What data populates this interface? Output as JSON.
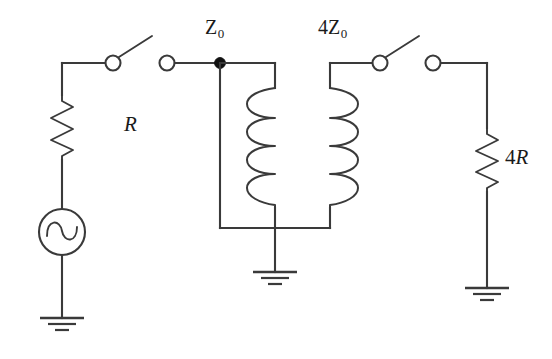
{
  "figure": {
    "name": "impedance-matching-transformer-circuit",
    "background_color": "#ffffff",
    "line_color": "#3a3a3a",
    "node_color": "#111111",
    "width": 552,
    "height": 359
  },
  "labels": {
    "source_resistor": "R",
    "load_resistor_prefix": "4",
    "load_resistor": "R",
    "primary_impedance_symbol": "Z",
    "primary_impedance_subscript": "0",
    "secondary_impedance_prefix": "4",
    "secondary_impedance_symbol": "Z",
    "secondary_impedance_subscript": "0"
  },
  "components": [
    {
      "name": "ac-voltage-source",
      "type": "ac-source",
      "symbol": "sine-wave-in-circle",
      "center": [
        62,
        232
      ],
      "radius": 23
    },
    {
      "name": "source-resistor",
      "type": "resistor",
      "symbol": "zigzag",
      "label": "R",
      "x": 62,
      "y_top": 95,
      "y_bottom": 160,
      "zigzag_peaks": 6
    },
    {
      "name": "load-resistor",
      "type": "resistor",
      "symbol": "zigzag",
      "label": "4R",
      "x": 487,
      "y_top": 128,
      "y_bottom": 192,
      "zigzag_peaks": 6
    },
    {
      "name": "transformer-primary-coil",
      "type": "inductor",
      "symbol": "coil",
      "turns": 4,
      "x": 275,
      "y_top": 88,
      "y_bottom": 208,
      "loops_face": "left"
    },
    {
      "name": "transformer-secondary-coil",
      "type": "inductor",
      "symbol": "coil",
      "turns": 4,
      "x": 330,
      "y_top": 88,
      "y_bottom": 208,
      "loops_face": "right"
    },
    {
      "name": "switch-left",
      "type": "switch",
      "state": "open",
      "pivot": [
        113,
        63
      ],
      "blade_end": [
        152,
        36
      ]
    },
    {
      "name": "switch-right",
      "type": "switch",
      "state": "open",
      "pivot": [
        380,
        63
      ],
      "blade_end": [
        419,
        36
      ]
    },
    {
      "name": "terminal-primary-input",
      "type": "terminal",
      "state": "open-circle",
      "position": [
        167,
        63
      ]
    },
    {
      "name": "terminal-load-input",
      "type": "terminal",
      "state": "open-circle",
      "position": [
        433,
        63
      ]
    },
    {
      "name": "junction-node-z0",
      "type": "node",
      "state": "filled-dot",
      "position": [
        220,
        63
      ]
    },
    {
      "name": "ground-source",
      "type": "ground",
      "symbol": "three-bar-earth",
      "position": [
        62,
        318
      ]
    },
    {
      "name": "ground-transformer-center",
      "type": "ground",
      "symbol": "three-bar-earth",
      "position": [
        275,
        272
      ]
    },
    {
      "name": "ground-load",
      "type": "ground",
      "symbol": "three-bar-earth",
      "position": [
        487,
        288
      ]
    }
  ]
}
